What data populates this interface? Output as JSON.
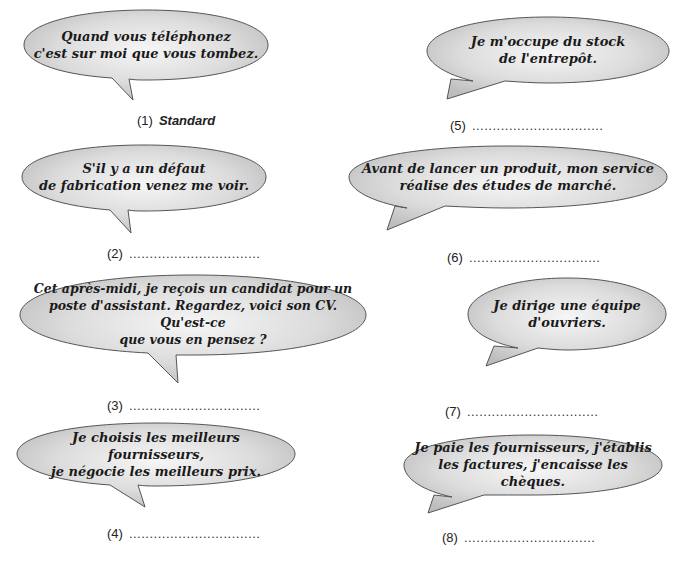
{
  "exercise": {
    "bubble_fill": "#d2d2d2",
    "bubble_highlight": "#f4f4f4",
    "bubble_stroke": "#555555",
    "items": [
      {
        "number": "(1)",
        "text": "Quand vous téléphonez\nc'est sur moi que vous tombez.",
        "answer": "Standard",
        "answer_dots": ""
      },
      {
        "number": "(2)",
        "text": "S'il y a un défaut\nde fabrication venez me voir.",
        "answer": "",
        "answer_dots": "................................"
      },
      {
        "number": "(3)",
        "text": "Cet après-midi, je reçois un candidat pour un\nposte d'assistant. Regardez, voici son CV. Qu'est-ce\nque vous en pensez ?",
        "answer": "",
        "answer_dots": "................................"
      },
      {
        "number": "(4)",
        "text": "Je choisis les meilleurs fournisseurs,\nje négocie les meilleurs prix.",
        "answer": "",
        "answer_dots": "................................"
      },
      {
        "number": "(5)",
        "text": "Je m'occupe du stock\nde l'entrepôt.",
        "answer": "",
        "answer_dots": "................................"
      },
      {
        "number": "(6)",
        "text": "Avant de lancer un produit, mon service\nréalise des études de marché.",
        "answer": "",
        "answer_dots": "................................"
      },
      {
        "number": "(7)",
        "text": "Je dirige une équipe\nd'ouvriers.",
        "answer": "",
        "answer_dots": "................................"
      },
      {
        "number": "(8)",
        "text": "Je paie les fournisseurs, j'établis\nles factures, j'encaisse les chèques.",
        "answer": "",
        "answer_dots": "................................"
      }
    ]
  }
}
